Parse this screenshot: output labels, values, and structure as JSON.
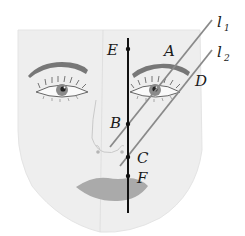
{
  "diagram": {
    "vertical_line": {
      "x": 128,
      "y1": 38,
      "y2": 213
    },
    "points": [
      {
        "label": "E",
        "x": 128,
        "y": 49,
        "label_x": 107,
        "label_y": 55
      },
      {
        "label": "B",
        "x": 128,
        "y": 124,
        "label_x": 110,
        "label_y": 128
      },
      {
        "label": "C",
        "x": 128,
        "y": 157,
        "label_x": 137,
        "label_y": 163
      },
      {
        "label": "F",
        "x": 128,
        "y": 176,
        "label_x": 137,
        "label_y": 183
      }
    ],
    "line_labels": {
      "A": "A",
      "D": "D",
      "l1_main": "l",
      "l1_sub": "1",
      "l2_main": "l",
      "l2_sub": "2"
    },
    "lines": [
      {
        "name": "l1",
        "x1": 110,
        "y1": 147,
        "x2": 212,
        "y2": 20
      },
      {
        "name": "l2",
        "x1": 120,
        "y1": 166,
        "x2": 212,
        "y2": 50
      }
    ],
    "colors": {
      "face": "#ededed",
      "face_shadow": "#e2e2e2",
      "brow": "#6f6f6f",
      "lips": "#a9a9a9",
      "lines": "#8a8a8a",
      "axis": "#111111",
      "iris": "#7a7a7a"
    }
  }
}
